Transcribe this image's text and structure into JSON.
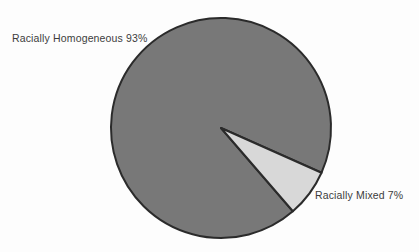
{
  "chart_data": {
    "type": "pie",
    "title": "",
    "subtitle": "",
    "xlabel": "",
    "ylabel": "",
    "grid": false,
    "legend_position": "none",
    "labels_position": "outside-callout",
    "background_color": "#fdfdfd",
    "outline_color": "#2b2b2b",
    "start_angle_deg": 24,
    "direction": "clockwise",
    "categories": [
      "Racially Homogeneous",
      "Racially Mixed"
    ],
    "values": [
      93,
      7
    ],
    "units": "percent",
    "slices": [
      {
        "name": "Racially Homogeneous",
        "value": 93,
        "value_text": "93%",
        "label": "Racially Homogeneous 93%",
        "color": "#787878",
        "angle_deg": 334.8
      },
      {
        "name": "Racially Mixed",
        "value": 7,
        "value_text": "7%",
        "label": "Racially Mixed 7%",
        "color": "#d8d8d8",
        "angle_deg": 25.2
      }
    ],
    "geometry": {
      "center_x": 221,
      "center_y": 128,
      "radius": 110
    }
  }
}
